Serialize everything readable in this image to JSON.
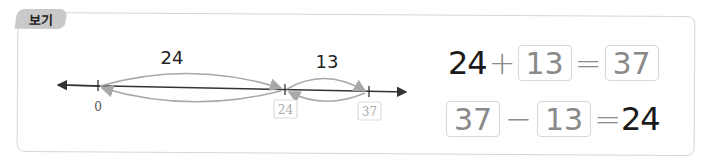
{
  "tab": {
    "label": "보기"
  },
  "number_line": {
    "ticks": [
      {
        "value": "0",
        "boxed": false
      },
      {
        "value": "24",
        "boxed": true
      },
      {
        "value": "37",
        "boxed": true
      }
    ],
    "jumps": [
      {
        "label": "24",
        "from": "0",
        "to": "24"
      },
      {
        "label": "13",
        "from": "24",
        "to": "37"
      }
    ]
  },
  "equations": {
    "addition": {
      "a": "24",
      "op": "+",
      "b": "13",
      "eq": "=",
      "result": "37"
    },
    "subtraction": {
      "a": "37",
      "op": "−",
      "b": "13",
      "eq": "=",
      "result": "24"
    }
  },
  "colors": {
    "line": "#333333",
    "arc": "#a8a8a8",
    "box_border": "#d8d8d8",
    "box_text": "#8a8a8a",
    "tab_bg": "#c9c9c9"
  }
}
